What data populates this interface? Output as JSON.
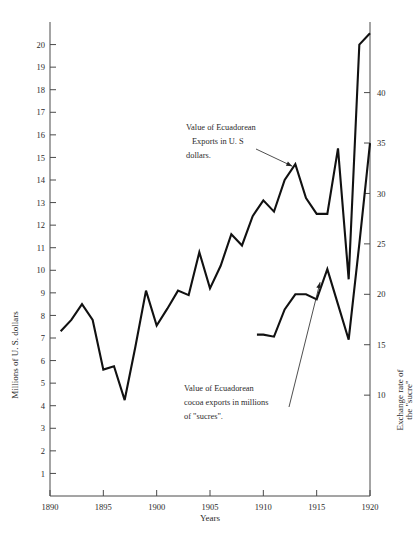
{
  "chart_data": {
    "type": "line",
    "title": "",
    "xlabel": "Years",
    "ylabel": "Millions of U. S. dollars",
    "y2label": "Exchange rate of the \"sucre\"",
    "xlim": [
      1890,
      1920
    ],
    "ylim": [
      0,
      21
    ],
    "y2lim": [
      0,
      47
    ],
    "grid": false,
    "legend": "annotations",
    "xticks": [
      1890,
      1895,
      1900,
      1905,
      1910,
      1915,
      1920
    ],
    "xticklabels": [
      "1890",
      "1895",
      "1900",
      "1905",
      "1910",
      "1915",
      "1920"
    ],
    "yticks": [
      1,
      2,
      3,
      4,
      5,
      6,
      7,
      8,
      9,
      10,
      11,
      12,
      13,
      14,
      15,
      16,
      17,
      18,
      19,
      20
    ],
    "yticklabels": [
      "1",
      "2",
      "3",
      "4",
      "5",
      "6",
      "7",
      "8",
      "9",
      "10",
      "11",
      "12",
      "13",
      "14",
      "15",
      "16",
      "17",
      "18",
      "19",
      "20"
    ],
    "y2ticks": [
      10,
      15,
      20,
      25,
      30,
      35,
      40
    ],
    "y2ticklabels": [
      "10",
      "15",
      "20",
      "25",
      "30",
      "35",
      "40"
    ],
    "series": [
      {
        "name": "Value of Ecuadorean Exports in U. S dollars.",
        "axis": "left",
        "x": [
          1891,
          1892,
          1893,
          1894,
          1895,
          1896,
          1897,
          1898,
          1899,
          1900,
          1901,
          1902,
          1903,
          1904,
          1905,
          1906,
          1907,
          1908,
          1909,
          1910,
          1911,
          1912,
          1913,
          1914,
          1915,
          1916,
          1917,
          1918,
          1919,
          1920
        ],
        "values": [
          7.3,
          7.8,
          8.5,
          7.8,
          5.6,
          5.75,
          4.25,
          6.6,
          9.1,
          7.55,
          8.3,
          9.1,
          8.9,
          10.8,
          9.2,
          10.2,
          11.6,
          11.1,
          12.4,
          13.1,
          12.6,
          14.0,
          14.7,
          13.2,
          12.5,
          12.5,
          15.4,
          9.6,
          20.0,
          20.5
        ]
      },
      {
        "name": "Value of Ecuadorean cocoa exports in millions of \"sucres\".",
        "axis": "right",
        "x": [
          1909.4,
          1910,
          1911,
          1912,
          1913,
          1914,
          1915,
          1916,
          1917,
          1918,
          1919,
          1920
        ],
        "values": [
          16.0,
          16.0,
          15.8,
          18.5,
          20.0,
          20.0,
          19.5,
          22.5,
          19.0,
          15.5,
          25.0,
          35.0
        ]
      }
    ],
    "annotations": [
      {
        "id": "exports-annotation",
        "lines": [
          "Value of  Ecuadorean",
          "Exports  in U. S",
          "dollars."
        ],
        "points_to": {
          "x": 1913,
          "y": 14.7
        }
      },
      {
        "id": "cocoa-annotation",
        "lines": [
          "Value of Ecuadorean",
          "cocoa exports in millions",
          "of \"sucres\"."
        ],
        "points_to": {
          "x": 1915.6,
          "y2": 21.0
        }
      }
    ]
  }
}
